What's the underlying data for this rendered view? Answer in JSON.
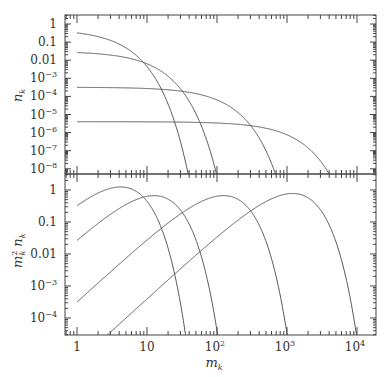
{
  "chart_data": [
    {
      "type": "line",
      "panel": "top",
      "xscale": "log",
      "yscale": "log",
      "xlim": [
        1,
        10000
      ],
      "ylim": [
        1e-08,
        1
      ],
      "xlabel": "m_k",
      "ylabel": "n_k",
      "ytick_labels": [
        "1",
        "0.1",
        "0.01",
        "10^-3",
        "10^-4",
        "10^-5",
        "10^-6",
        "10^-7",
        "10^-8"
      ],
      "series": [
        {
          "name": "curve 1",
          "formula": "0.52*exp(-m/2.1)",
          "x": [
            1,
            2,
            3,
            5,
            8,
            12,
            16,
            18
          ],
          "y": [
            0.32,
            0.2,
            0.13,
            0.05,
            0.011,
            0.0017,
            0.00025,
            0.0001
          ]
        },
        {
          "name": "curve 2",
          "formula": "0.031*exp(-m/6.3)",
          "x": [
            1,
            5,
            10,
            20,
            40,
            60,
            75
          ],
          "y": [
            0.027,
            0.014,
            0.0063,
            0.0013,
            5.4e-05,
            2.2e-06,
            2.2e-07
          ]
        },
        {
          "name": "curve 3",
          "formula": "3.2e-4*exp(-m/62)",
          "x": [
            1,
            10,
            50,
            100,
            200,
            400,
            600
          ],
          "y": [
            0.00032,
            0.00028,
            0.00014,
            6.4e-05,
            1.3e-05,
            5e-07,
            2e-08
          ]
        },
        {
          "name": "curve 4",
          "formula": "4e-6*exp(-m/600)",
          "x": [
            1,
            10,
            100,
            500,
            1000,
            2000,
            3500
          ],
          "y": [
            4e-06,
            3.9e-06,
            3.4e-06,
            1.7e-06,
            7.6e-07,
            1.4e-07,
            1.2e-08
          ]
        }
      ]
    },
    {
      "type": "line",
      "panel": "bottom",
      "xscale": "log",
      "yscale": "log",
      "xlim": [
        1,
        10000
      ],
      "ylim": [
        3e-05,
        3
      ],
      "xlabel": "m_k",
      "ylabel": "m_k^2 n_k",
      "xtick_labels": [
        "1",
        "10",
        "10^2",
        "10^3",
        "10^4"
      ],
      "ytick_labels": [
        "1",
        "0.1",
        "0.01",
        "10^-3",
        "10^-4"
      ],
      "series": [
        {
          "name": "curve 1",
          "formula": "m^2*0.52*exp(-m/2.1)"
        },
        {
          "name": "curve 2",
          "formula": "m^2*0.031*exp(-m/6.3)"
        },
        {
          "name": "curve 3",
          "formula": "m^2*3.2e-4*exp(-m/62)"
        },
        {
          "name": "curve 4",
          "formula": "m^2*4e-6*exp(-m/600)"
        }
      ]
    }
  ],
  "labels": {
    "top_ylabel": "n",
    "top_ylabel_sub": "k",
    "bottom_ylabel_m": "m",
    "bottom_ylabel_sup": "2",
    "bottom_ylabel_sub": "k",
    "bottom_ylabel_n": "n",
    "bottom_ylabel_nsub": "k",
    "xlabel": "m",
    "xlabel_sub": "k"
  },
  "ticks": {
    "top_y": [
      {
        "base": "1",
        "exp": ""
      },
      {
        "base": "0.1",
        "exp": ""
      },
      {
        "base": "0.01",
        "exp": ""
      },
      {
        "base": "10",
        "exp": "−3"
      },
      {
        "base": "10",
        "exp": "−4"
      },
      {
        "base": "10",
        "exp": "−5"
      },
      {
        "base": "10",
        "exp": "−6"
      },
      {
        "base": "10",
        "exp": "−7"
      },
      {
        "base": "10",
        "exp": "−8"
      }
    ],
    "bottom_y": [
      {
        "base": "1",
        "exp": ""
      },
      {
        "base": "0.1",
        "exp": ""
      },
      {
        "base": "0.01",
        "exp": ""
      },
      {
        "base": "10",
        "exp": "−3"
      },
      {
        "base": "10",
        "exp": "−4"
      }
    ],
    "x": [
      {
        "base": "1",
        "exp": ""
      },
      {
        "base": "10",
        "exp": ""
      },
      {
        "base": "10",
        "exp": "2"
      },
      {
        "base": "10",
        "exp": "3"
      },
      {
        "base": "10",
        "exp": "4"
      }
    ]
  }
}
